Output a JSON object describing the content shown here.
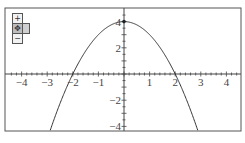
{
  "chart_data": {
    "type": "line",
    "title": "",
    "function": "y = 4 - x^2",
    "xlabel": "",
    "ylabel": "",
    "xlim": [
      -4.5,
      4.6
    ],
    "ylim": [
      -4.4,
      5.0
    ],
    "x_ticks": [
      -4,
      -3,
      -2,
      -1,
      1,
      2,
      3,
      4
    ],
    "x_tick_labels": [
      "−4",
      "−3",
      "−2",
      "−1",
      "1",
      "2",
      "3",
      "4"
    ],
    "y_ticks": [
      4,
      2,
      -2,
      -4
    ],
    "y_tick_labels": [
      "4",
      "2",
      "−2",
      "−4"
    ],
    "grid": false,
    "legend": null,
    "series": [
      {
        "name": "parabola",
        "x": [
          -2.86,
          -2.5,
          -2,
          -1.5,
          -1,
          -0.5,
          0,
          0.5,
          1,
          1.5,
          2,
          2.5,
          2.86
        ],
        "values": [
          -4.18,
          -2.25,
          0,
          1.75,
          3,
          3.75,
          4,
          3.75,
          3,
          1.75,
          0,
          -2.25,
          -4.18
        ]
      }
    ],
    "annotations": [
      {
        "type": "point",
        "x": 0,
        "y": 4,
        "label": "vertex"
      }
    ]
  },
  "controls": {
    "zoom_in": "+",
    "pan": "✥",
    "zoom_out": "−"
  },
  "colors": {
    "curve": "#333333",
    "axes": "#444444",
    "frame": "#555555"
  }
}
